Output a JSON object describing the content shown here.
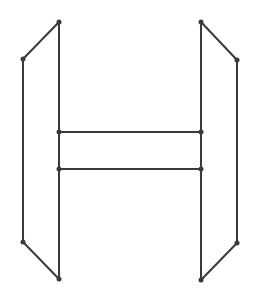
{
  "diagram": {
    "width": 259,
    "height": 303,
    "stroke_color": "#3a3a3a",
    "node_color": "#3a3a3a",
    "stroke_width": 2,
    "node_radius": 2.5,
    "nodes": [
      {
        "id": "L_top_inner",
        "x": 59,
        "y": 22
      },
      {
        "id": "L_top_outer",
        "x": 23,
        "y": 59
      },
      {
        "id": "L_mid_upper",
        "x": 59,
        "y": 132
      },
      {
        "id": "L_mid_lower",
        "x": 59,
        "y": 169
      },
      {
        "id": "L_bot_outer",
        "x": 23,
        "y": 242
      },
      {
        "id": "L_bot_inner",
        "x": 59,
        "y": 279
      },
      {
        "id": "R_top_inner",
        "x": 201,
        "y": 22
      },
      {
        "id": "R_top_outer",
        "x": 237,
        "y": 60
      },
      {
        "id": "R_mid_upper",
        "x": 201,
        "y": 132
      },
      {
        "id": "R_mid_lower",
        "x": 201,
        "y": 169
      },
      {
        "id": "R_bot_outer",
        "x": 237,
        "y": 243
      },
      {
        "id": "R_bot_inner",
        "x": 201,
        "y": 280
      }
    ],
    "edges": [
      [
        "L_top_inner",
        "L_top_outer"
      ],
      [
        "L_top_outer",
        "L_bot_outer"
      ],
      [
        "L_bot_outer",
        "L_bot_inner"
      ],
      [
        "L_top_inner",
        "L_bot_inner"
      ],
      [
        "R_top_inner",
        "R_top_outer"
      ],
      [
        "R_top_outer",
        "R_bot_outer"
      ],
      [
        "R_bot_outer",
        "R_bot_inner"
      ],
      [
        "R_top_inner",
        "R_bot_inner"
      ],
      [
        "L_mid_upper",
        "R_mid_upper"
      ],
      [
        "L_mid_lower",
        "R_mid_lower"
      ]
    ]
  }
}
